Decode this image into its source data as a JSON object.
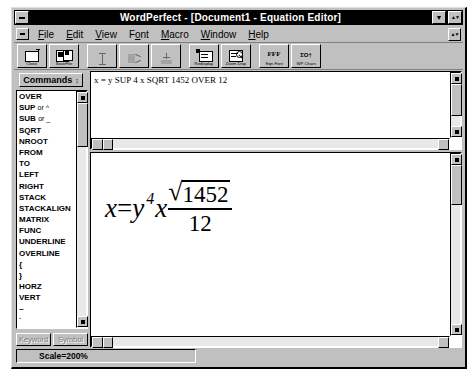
{
  "window": {
    "title": "WordPerfect - [Document1 - Equation Editor]",
    "system_menu_icon": "system-menu-icon",
    "minimize_label": "Minimize",
    "maximize_label": "Maximize",
    "mdi_restore_label": "Restore"
  },
  "menubar": {
    "items": [
      {
        "label": "File",
        "accel": "F"
      },
      {
        "label": "Edit",
        "accel": "E"
      },
      {
        "label": "View",
        "accel": "V"
      },
      {
        "label": "Font",
        "accel": "o"
      },
      {
        "label": "Macro",
        "accel": "M"
      },
      {
        "label": "Window",
        "accel": "W"
      },
      {
        "label": "Help",
        "accel": "H"
      }
    ]
  },
  "toolbar": {
    "buttons": [
      {
        "label": "Close",
        "icon": "close-doc-icon",
        "enabled": true
      },
      {
        "label": "SaveFile",
        "icon": "save-file-icon",
        "enabled": true
      },
      {
        "label": "",
        "icon": "insert-icon",
        "enabled": false
      },
      {
        "label": "",
        "icon": "cut-icon",
        "enabled": false
      },
      {
        "label": "",
        "icon": "paste-icon",
        "enabled": false
      },
      {
        "label": "Redisplay",
        "icon": "redisplay-icon",
        "enabled": true
      },
      {
        "label": "Zoom Disp",
        "icon": "zoom-display-icon",
        "enabled": true
      },
      {
        "label": "Eqn Font",
        "icon": "eqn-font-icon",
        "enabled": true
      },
      {
        "label": "WP Chars",
        "icon": "wp-chars-icon",
        "enabled": true
      }
    ]
  },
  "palette": {
    "selector_label": "Commands",
    "commands": [
      {
        "name": "OVER"
      },
      {
        "name": "SUP",
        "alt": "or ^"
      },
      {
        "name": "SUB",
        "alt": "or _"
      },
      {
        "name": "SQRT"
      },
      {
        "name": "NROOT"
      },
      {
        "name": "FROM"
      },
      {
        "name": "TO"
      },
      {
        "name": "LEFT"
      },
      {
        "name": "RIGHT"
      },
      {
        "name": "STACK"
      },
      {
        "name": "STACKALIGN"
      },
      {
        "name": "MATRIX"
      },
      {
        "name": "FUNC"
      },
      {
        "name": "UNDERLINE"
      },
      {
        "name": "OVERLINE"
      },
      {
        "name": "{"
      },
      {
        "name": "}"
      },
      {
        "name": "HORZ"
      },
      {
        "name": "VERT"
      },
      {
        "name": "~"
      },
      {
        "name": "`"
      },
      {
        "name": "BINOM"
      },
      {
        "name": "&"
      },
      {
        "name": "#"
      },
      {
        "name": "MATFORM"
      },
      {
        "name": "ALIGNL"
      },
      {
        "name": "ALIGNR"
      },
      {
        "name": "ALIGNC"
      }
    ],
    "keyword_button": "Keyword",
    "symbol_button": "Symbol"
  },
  "editor": {
    "equation_source": "x = y SUP 4 x SQRT 1452 OVER 12"
  },
  "display": {
    "equation": {
      "lhs": "x",
      "equals": "=",
      "base": "y",
      "exponent": "4",
      "multiplier": "x",
      "numerator_radicand": "1452",
      "radical_symbol": "√",
      "denominator": "12"
    }
  },
  "statusbar": {
    "scale_text": "Scale=200%"
  },
  "colors": {
    "face": "#c0c0c0",
    "shadow": "#808080",
    "highlight": "#ffffff",
    "titlebar": "#000000",
    "titlebar_text": "#ffffff",
    "client": "#ffffff",
    "trough": "#e8e8e8",
    "disabled_text": "#808080"
  }
}
